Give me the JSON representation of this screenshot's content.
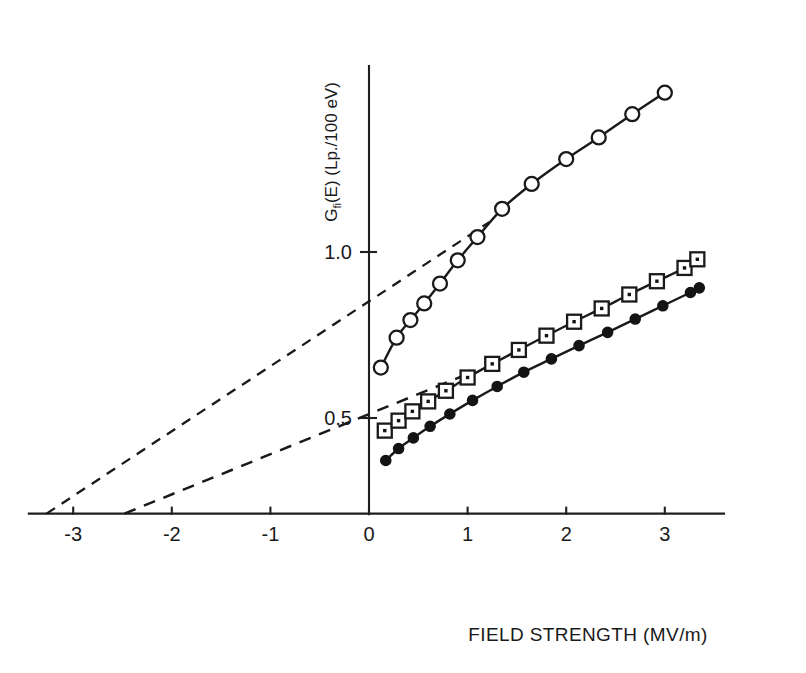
{
  "chart_data": {
    "type": "line",
    "title": "",
    "subtitle": "",
    "xlabel": "FIELD STRENGTH (MV/m)",
    "ylabel": "G_fi(E) (Lp./100 eV)",
    "ylabel_main": "G",
    "ylabel_sub": "fi",
    "ylabel_rest": "(E) (Lp./100 eV)",
    "xlim": [
      -3.45,
      3.6
    ],
    "ylim": [
      0.21,
      1.56
    ],
    "xticks": [
      -3,
      -2,
      -1,
      0,
      1,
      2,
      3
    ],
    "xtick_labels": [
      "-3",
      "-2",
      "-1",
      "0",
      "1",
      "2",
      "3"
    ],
    "yticks": [
      0.5,
      1.0
    ],
    "ytick_labels": [
      "0.5",
      "1.0"
    ],
    "grid": false,
    "legend_position": "none",
    "axis_style": "cross-at-zero",
    "series": [
      {
        "name": "open-circles",
        "marker": "open-circle",
        "marker_size": 7,
        "x": [
          0.12,
          0.28,
          0.42,
          0.56,
          0.72,
          0.9,
          1.1,
          1.35,
          1.65,
          2.0,
          2.33,
          2.67,
          3.0
        ],
        "y": [
          0.652,
          0.742,
          0.795,
          0.845,
          0.905,
          0.975,
          1.045,
          1.13,
          1.205,
          1.28,
          1.345,
          1.415,
          1.48
        ]
      },
      {
        "name": "open-squares",
        "marker": "open-square-dot",
        "marker_size": 7,
        "x": [
          0.16,
          0.3,
          0.44,
          0.6,
          0.78,
          1.0,
          1.25,
          1.52,
          1.8,
          2.08,
          2.36,
          2.64,
          2.92,
          3.2,
          3.33
        ],
        "y": [
          0.462,
          0.492,
          0.52,
          0.55,
          0.582,
          0.622,
          0.663,
          0.705,
          0.748,
          0.79,
          0.83,
          0.872,
          0.912,
          0.952,
          0.978
        ]
      },
      {
        "name": "filled-circles",
        "marker": "filled-circle",
        "marker_size": 5,
        "x": [
          0.17,
          0.3,
          0.45,
          0.62,
          0.82,
          1.05,
          1.3,
          1.57,
          1.85,
          2.13,
          2.42,
          2.7,
          2.98,
          3.26,
          3.35
        ],
        "y": [
          0.372,
          0.408,
          0.44,
          0.475,
          0.512,
          0.553,
          0.595,
          0.638,
          0.678,
          0.718,
          0.758,
          0.798,
          0.838,
          0.878,
          0.892
        ]
      }
    ],
    "extrapolations": [
      {
        "name": "upper-dashed-extrapolation",
        "x_intercept": -3.27,
        "x_start": -3.27,
        "y_start": 0.212,
        "x_end": 1.22,
        "y_end": 1.09,
        "note": "dashed line extrapolating the upper linear branch of the open-circle curve back to the field-strength axis"
      },
      {
        "name": "lower-dashed-extrapolation",
        "x_intercept": -2.48,
        "x_start": -2.48,
        "y_start": 0.212,
        "x_end": 1.02,
        "y_end": 0.635,
        "note": "dashed line extrapolating the linear branch of the open-square curve back to the field-strength axis"
      }
    ],
    "annotations": []
  }
}
